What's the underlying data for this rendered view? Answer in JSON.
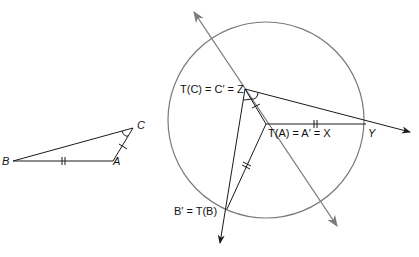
{
  "diagram": {
    "colors": {
      "ink": "#1a1a1a",
      "grey": "#7a7a7a",
      "background": "#ffffff"
    },
    "original_triangle": {
      "points": {
        "B": [
          13,
          161
        ],
        "A": [
          113,
          161
        ],
        "C": [
          133,
          128
        ]
      },
      "labels": {
        "B": "B",
        "A": "A",
        "C": "C"
      },
      "marks": {
        "BA": "double-tick",
        "AC": "single-tick",
        "C": "angle-arc"
      }
    },
    "image": {
      "points": {
        "Z": [
          245,
          89
        ],
        "X": [
          266,
          124
        ],
        "Y": [
          366,
          124
        ],
        "Bp": [
          227,
          209
        ]
      },
      "labels": {
        "Z": "T(C) = C′ = Z",
        "X": "T(A) = A′ = X",
        "Y": "Y",
        "Bp": "B′ = T(B)"
      },
      "marks": {
        "XY": "double-tick",
        "ZX": "single-tick",
        "XBp": "double-tick",
        "Z": "angle-arc"
      }
    },
    "circle": {
      "center": [
        266,
        120
      ],
      "radius": 98,
      "color": "#7a7a7a"
    },
    "rays": [
      {
        "name": "ray-ZY",
        "from": [
          245,
          89
        ],
        "to": [
          410,
          132
        ],
        "color": "#1a1a1a"
      },
      {
        "name": "ray-ZBp",
        "from": [
          245,
          89
        ],
        "to": [
          220,
          243
        ],
        "color": "#1a1a1a"
      },
      {
        "name": "grey-line",
        "from": [
          337,
          226
        ],
        "to": [
          194,
          12
        ],
        "color": "#7a7a7a",
        "double_arrow": true
      }
    ]
  }
}
